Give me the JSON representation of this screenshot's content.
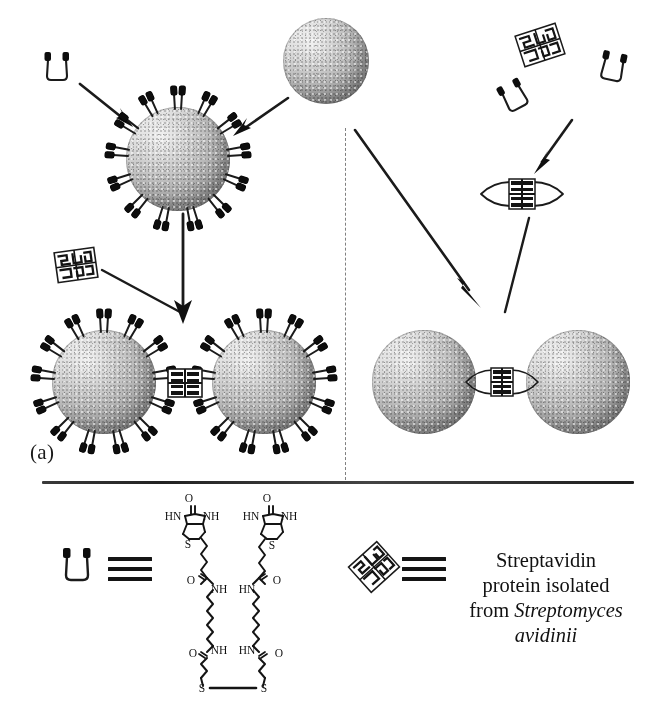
{
  "figure": {
    "panels": [
      {
        "id": "a",
        "label": "(a)",
        "description": "Biotinylated gold nanoparticles cross-linked by streptavidin"
      },
      {
        "id": "b",
        "label": "(b)",
        "description": "Bare gold nanoparticles linked by a preformed biotin-streptavidin complex"
      }
    ]
  },
  "legend": {
    "biotin_symbol_name": "biotin-cup-icon",
    "streptavidin_symbol_name": "streptavidin-hatched-square-icon",
    "equivalence_symbol": "identical-to",
    "streptavidin_text_line1": "Streptavidin",
    "streptavidin_text_line2": "protein isolated",
    "streptavidin_text_line3_prefix": "from ",
    "streptavidin_text_genus": "Streptomyces",
    "streptavidin_text_species": "avidinii"
  },
  "chem_structure": {
    "name": "biotin-disulfide-linker",
    "labels": {
      "carbonyl_o_left": "O",
      "carbonyl_o_right": "O",
      "ureido_hn_left": "HN",
      "ureido_nh_left": "NH",
      "ureido_hn_right": "HN",
      "ureido_nh_right": "NH",
      "thiophene_s_left": "S",
      "thiophene_s_right": "S",
      "amide1_o_left": "O",
      "amide1_nh_left": "NH",
      "amide1_hn_right": "HN",
      "amide1_o_right": "O",
      "amide2_o_left": "O",
      "amide2_nh_left": "NH",
      "amide2_hn_right": "HN",
      "amide2_o_right": "O",
      "disulfide_s_left": "S",
      "disulfide_s_right": "S"
    }
  },
  "colors": {
    "ink": "#111111",
    "particle_light": "#f2f2f2",
    "particle_mid": "#b9b9b9",
    "particle_dark": "#8a8a8a",
    "divider": "#3a3a3a"
  }
}
